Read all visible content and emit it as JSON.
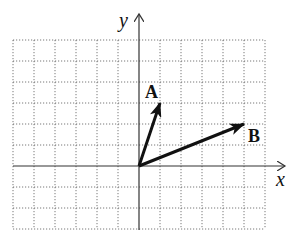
{
  "diagram": {
    "type": "coordinate-plane-vectors",
    "axes": {
      "x_label": "x",
      "y_label": "y"
    },
    "grid": {
      "x_min": -6,
      "x_max": 6,
      "y_min": -3,
      "y_max": 6,
      "unit": 1
    },
    "vectors": [
      {
        "name": "A",
        "label": "A",
        "from": [
          0,
          0
        ],
        "to": [
          1,
          3
        ]
      },
      {
        "name": "B",
        "label": "B",
        "from": [
          0,
          0
        ],
        "to": [
          5,
          2
        ]
      }
    ]
  }
}
